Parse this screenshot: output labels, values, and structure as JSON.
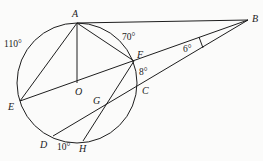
{
  "diagram": {
    "type": "circle-geometry",
    "circle": {
      "center": "O",
      "cx": 77,
      "cy": 83,
      "r": 60
    },
    "points": {
      "A": {
        "label": "A",
        "x": 77,
        "y": 23,
        "lx": 72,
        "ly": 17
      },
      "B": {
        "label": "B",
        "x": 248,
        "y": 20,
        "lx": 252,
        "ly": 22
      },
      "F": {
        "label": "F",
        "x": 134,
        "y": 61,
        "lx": 137,
        "ly": 58
      },
      "C": {
        "label": "C",
        "x": 137,
        "y": 87,
        "lx": 142,
        "ly": 94
      },
      "O": {
        "label": "O",
        "x": 77,
        "y": 83,
        "lx": 75,
        "ly": 95
      },
      "E": {
        "label": "E",
        "x": 20,
        "y": 101,
        "lx": 8,
        "ly": 110
      },
      "G": {
        "label": "G",
        "x": 104,
        "y": 104,
        "lx": 93,
        "ly": 104
      },
      "D": {
        "label": "D",
        "x": 53,
        "y": 136,
        "lx": 40,
        "ly": 148
      },
      "H": {
        "label": "H",
        "x": 83,
        "y": 141,
        "lx": 79,
        "ly": 152
      }
    },
    "angles": {
      "arc_AE": {
        "text": "110°",
        "x": 4,
        "y": 47
      },
      "arc_AF": {
        "text": "70°",
        "x": 122,
        "y": 40
      },
      "arc_FC": {
        "text": "8°",
        "x": 139,
        "y": 75
      },
      "angle_B": {
        "text": "6°",
        "x": 183,
        "y": 52
      },
      "arc_DH": {
        "text": "10°",
        "x": 57,
        "y": 150
      }
    },
    "segments": [
      [
        "A",
        "B"
      ],
      [
        "A",
        "F"
      ],
      [
        "A",
        "O"
      ],
      [
        "A",
        "E"
      ],
      [
        "E",
        "B"
      ],
      [
        "D",
        "B"
      ],
      [
        "F",
        "H"
      ]
    ]
  }
}
